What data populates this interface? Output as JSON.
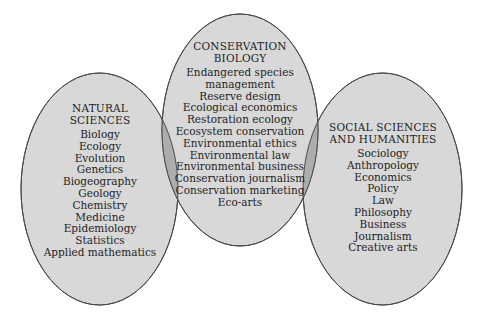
{
  "colors": {
    "fill": "#d8d8d8",
    "overlap": "#adadad",
    "stroke": "#4a4a4a",
    "text": "#1e1e1e"
  },
  "circles": {
    "natural": {
      "heading": [
        "NATURAL",
        "SCIENCES"
      ],
      "items": [
        "Biology",
        "Ecology",
        "Evolution",
        "Genetics",
        "Biogeography",
        "Geology",
        "Chemistry",
        "Medicine",
        "Epidemiology",
        "Statistics",
        "Applied mathematics"
      ]
    },
    "conservation": {
      "heading": [
        "CONSERVATION",
        "BIOLOGY"
      ],
      "items": [
        "Endangered species",
        "management",
        "Reserve design",
        "Ecological economics",
        "Restoration ecology",
        "Ecosystem conservation",
        "Environmental ethics",
        "Environmental law",
        "Environmental business",
        "Conservation journalism",
        "Conservation marketing",
        "Eco-arts"
      ]
    },
    "social": {
      "heading": [
        "SOCIAL SCIENCES",
        "AND HUMANITIES"
      ],
      "items": [
        "Sociology",
        "Anthropology",
        "Economics",
        "Policy",
        "Law",
        "Philosophy",
        "Business",
        "Journalism",
        "Creative arts"
      ]
    }
  }
}
